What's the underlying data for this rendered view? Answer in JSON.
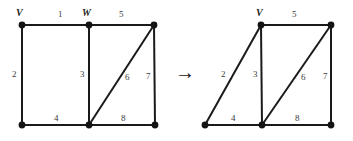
{
  "figure": {
    "background_color": "#ffffff",
    "edge_color": "#1a1a1a",
    "vertex_color": "#141414",
    "label_color": "#3a3a3a"
  },
  "transform_arrow": {
    "glyph": "→",
    "name": "rightwards-arrow"
  },
  "left_graph": {
    "name": "original-graph",
    "vertex_labels": [
      {
        "text": "V",
        "x": 16,
        "y": 8
      },
      {
        "text": "W",
        "x": 82,
        "y": 8
      }
    ],
    "vertices": [
      {
        "id": "v",
        "x": 22,
        "y": 25
      },
      {
        "id": "w",
        "x": 89,
        "y": 25
      },
      {
        "id": "tr",
        "x": 154,
        "y": 25
      },
      {
        "id": "bl",
        "x": 22,
        "y": 125
      },
      {
        "id": "bm",
        "x": 89,
        "y": 125
      },
      {
        "id": "br",
        "x": 155,
        "y": 125
      }
    ],
    "edges": [
      {
        "label": "1",
        "from": "v",
        "to": "w",
        "lx": 58,
        "ly": 10
      },
      {
        "label": "5",
        "from": "w",
        "to": "tr",
        "lx": 119,
        "ly": 10
      },
      {
        "label": "2",
        "from": "v",
        "to": "bl",
        "lx": 12,
        "ly": 70
      },
      {
        "label": "3",
        "from": "w",
        "to": "bm",
        "lx": 80,
        "ly": 70
      },
      {
        "label": "7",
        "from": "tr",
        "to": "br",
        "lx": 146,
        "ly": 72
      },
      {
        "label": "6",
        "from": "bm",
        "to": "tr",
        "lx": 125,
        "ly": 73
      },
      {
        "label": "4",
        "from": "bl",
        "to": "bm",
        "lx": 54,
        "ly": 114
      },
      {
        "label": "8",
        "from": "bm",
        "to": "br",
        "lx": 121,
        "ly": 114
      }
    ]
  },
  "right_graph": {
    "name": "contracted-graph",
    "vertex_labels": [
      {
        "text": "V",
        "x": 256,
        "y": 8
      }
    ],
    "vertices": [
      {
        "id": "vw",
        "x": 261,
        "y": 25
      },
      {
        "id": "tr",
        "x": 331,
        "y": 25
      },
      {
        "id": "bl",
        "x": 205,
        "y": 125
      },
      {
        "id": "bm",
        "x": 262,
        "y": 125
      },
      {
        "id": "br",
        "x": 331,
        "y": 125
      }
    ],
    "edges": [
      {
        "label": "5",
        "from": "vw",
        "to": "tr",
        "lx": 292,
        "ly": 10
      },
      {
        "label": "2",
        "from": "vw",
        "to": "bl",
        "lx": 221,
        "ly": 70
      },
      {
        "label": "3",
        "from": "vw",
        "to": "bm",
        "lx": 253,
        "ly": 70
      },
      {
        "label": "7",
        "from": "tr",
        "to": "br",
        "lx": 323,
        "ly": 72
      },
      {
        "label": "6",
        "from": "bm",
        "to": "tr",
        "lx": 301,
        "ly": 73
      },
      {
        "label": "4",
        "from": "bl",
        "to": "bm",
        "lx": 231,
        "ly": 114
      },
      {
        "label": "8",
        "from": "bm",
        "to": "br",
        "lx": 295,
        "ly": 114
      }
    ]
  }
}
